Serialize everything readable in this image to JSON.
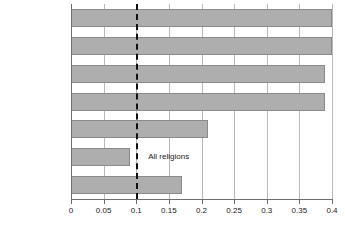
{
  "chart_data": {
    "type": "bar",
    "orientation": "horizontal",
    "title": "",
    "xlabel": "",
    "ylabel": "",
    "xlim": [
      0,
      0.4
    ],
    "grid": true,
    "legend": false,
    "categories": [
      "Hindu",
      "Sikh",
      "Jewish",
      "Muslim",
      "Buddhist",
      "Christian",
      "Other religions"
    ],
    "values": [
      0.4,
      0.4,
      0.39,
      0.39,
      0.21,
      0.09,
      0.17
    ],
    "xticks": [
      0,
      0.05,
      0.1,
      0.15,
      0.2,
      0.25,
      0.3,
      0.35,
      0.4
    ],
    "xtick_labels": [
      "0",
      "0.05",
      "0.1",
      "0.15",
      "0.2",
      "0.25",
      "0.3",
      "0.35",
      "0.4"
    ],
    "annotations": [
      {
        "text": "All religions",
        "type": "reference-line-label",
        "x": 0.1
      }
    ],
    "reference_line": {
      "value": 0.1,
      "style": "dashed",
      "color": "#111111",
      "label": "All religions"
    },
    "colors": {
      "bar_fill": "#aeaeae",
      "bar_edge": "#8a8a8a",
      "gridline": "#b9b9b9",
      "axis": "#6e6e6e",
      "text": "#1a1a1a",
      "background": "#ffffff"
    }
  }
}
